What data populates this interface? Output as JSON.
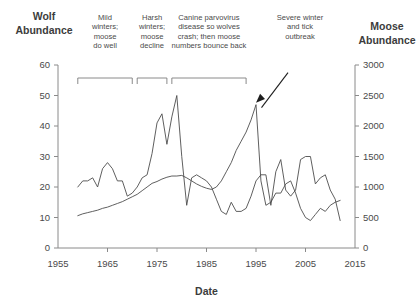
{
  "chart_data": {
    "type": "line",
    "title": "",
    "xlabel": "Date",
    "ylabel_left": "Wolf Abundance",
    "ylabel_right": "Moose Abundance",
    "grid": false,
    "legend_position": "none",
    "xlim": [
      1955,
      2015
    ],
    "xticks": [
      1955,
      1965,
      1975,
      1985,
      1995,
      2005,
      2015
    ],
    "left_axis": {
      "label": "Wolf\nAbundance",
      "label_line1": "Wolf",
      "label_line2": "Abundance",
      "ylim": [
        0,
        60
      ],
      "yticks": [
        0,
        10,
        20,
        30,
        40,
        50,
        60
      ],
      "ytick_labels": [
        "0",
        "10",
        "20",
        "30",
        "40",
        "50",
        "60"
      ]
    },
    "right_axis": {
      "label_line1": "Moose",
      "label_line2": "Abundance",
      "ylim": [
        0,
        3000
      ],
      "yticks": [
        0,
        500,
        1000,
        1500,
        2000,
        2500,
        3000
      ],
      "ytick_labels": [
        "0",
        "500",
        "1000",
        "1500",
        "2000",
        "2500",
        "3000"
      ]
    },
    "series": [
      {
        "name": "Wolf abundance",
        "axis": "left",
        "x": [
          1959,
          1960,
          1961,
          1962,
          1963,
          1964,
          1965,
          1966,
          1967,
          1968,
          1969,
          1970,
          1971,
          1972,
          1973,
          1974,
          1975,
          1976,
          1977,
          1978,
          1979,
          1980,
          1981,
          1982,
          1983,
          1984,
          1985,
          1986,
          1987,
          1988,
          1989,
          1990,
          1991,
          1992,
          1993,
          1994,
          1995,
          1996,
          1997,
          1998,
          1999,
          2000,
          2001,
          2002,
          2003,
          2004,
          2005,
          2006,
          2007,
          2008,
          2009,
          2010,
          2011,
          2012
        ],
        "values": [
          20,
          22,
          22,
          23,
          20,
          26,
          28,
          26,
          22,
          22,
          17,
          18,
          20,
          23,
          24,
          31,
          41,
          44,
          34,
          43,
          50,
          30,
          14,
          23,
          24,
          23,
          22,
          20,
          16,
          12,
          11,
          15,
          12,
          12,
          13,
          17,
          22,
          24,
          24,
          14,
          25,
          29,
          19,
          17,
          19,
          29,
          30,
          30,
          21,
          23,
          24,
          19,
          16,
          9
        ],
        "peak_note": "50 in 1980, crash to ~14 in 1981"
      },
      {
        "name": "Moose abundance",
        "axis": "right",
        "x": [
          1959,
          1960,
          1961,
          1962,
          1963,
          1964,
          1965,
          1966,
          1967,
          1968,
          1969,
          1970,
          1971,
          1972,
          1973,
          1974,
          1975,
          1976,
          1977,
          1978,
          1979,
          1980,
          1981,
          1982,
          1983,
          1984,
          1985,
          1986,
          1987,
          1988,
          1989,
          1990,
          1991,
          1992,
          1993,
          1994,
          1995,
          1996,
          1997,
          1998,
          1999,
          2000,
          2001,
          2002,
          2003,
          2004,
          2005,
          2006,
          2007,
          2008,
          2009,
          2010,
          2011,
          2012
        ],
        "values": [
          530,
          560,
          580,
          600,
          620,
          650,
          670,
          700,
          730,
          760,
          800,
          840,
          880,
          940,
          1000,
          1060,
          1090,
          1130,
          1160,
          1180,
          1180,
          1190,
          1150,
          1100,
          1050,
          1010,
          980,
          960,
          1000,
          1100,
          1250,
          1400,
          1600,
          1750,
          1900,
          2100,
          2350,
          1100,
          700,
          750,
          900,
          900,
          1050,
          1100,
          900,
          650,
          500,
          450,
          550,
          650,
          600,
          700,
          750,
          780
        ],
        "peak_note": "2350 in 1995, crash to ~700 in 1997"
      }
    ],
    "annotations": [
      {
        "id": "mild-winters",
        "lines": [
          "Mild",
          "winters;",
          "moose",
          "do well"
        ],
        "bracket_x_start": 1959,
        "bracket_x_end": 1970
      },
      {
        "id": "harsh-winters",
        "lines": [
          "Harsh",
          "winters;",
          "moose",
          "decline"
        ],
        "bracket_x_start": 1971,
        "bracket_x_end": 1977
      },
      {
        "id": "canine-parvovirus",
        "lines": [
          "Canine parvovirus",
          "disease so wolves",
          "crash; then moose",
          "numbers bounce back"
        ],
        "bracket_x_start": 1978,
        "bracket_x_end": 1993
      },
      {
        "id": "severe-winter-tick",
        "lines": [
          "Severe winter",
          "and tick",
          "outbreak"
        ],
        "arrow_target_x": 1995,
        "arrow_target_y": 2350
      }
    ],
    "colors": {
      "background": "#ffffff",
      "axis": "#8a8a8a",
      "line": "#4d4d4d",
      "text": "#3f3f3f",
      "arrow": "#1e1e1e"
    }
  }
}
